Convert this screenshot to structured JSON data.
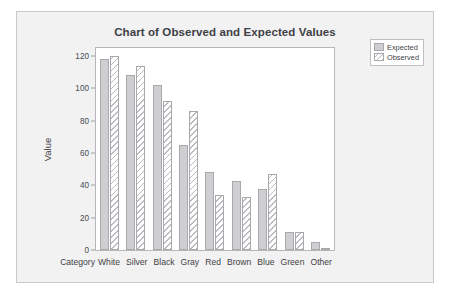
{
  "chart_data": {
    "type": "bar",
    "title": "Chart of Observed and Expected Values",
    "xlabel": "Category",
    "ylabel": "Value",
    "ylim": [
      0,
      125
    ],
    "yticks": [
      0,
      20,
      40,
      60,
      80,
      100,
      120
    ],
    "ytick_labels": [
      "0",
      "20",
      "40",
      "60",
      "80",
      "100",
      "120"
    ],
    "grid": false,
    "legend_position": "top-right-outside",
    "categories": [
      "White",
      "Silver",
      "Black",
      "Gray",
      "Red",
      "Brown",
      "Blue",
      "Green",
      "Other"
    ],
    "series": [
      {
        "name": "Expected",
        "style": "solid-gray-fill",
        "color": "#cfcfd1",
        "values": [
          118,
          108,
          102,
          65,
          48,
          43,
          37.5,
          11,
          5
        ]
      },
      {
        "name": "Observed",
        "style": "diagonal-hatch",
        "color": "#bcbcc0",
        "values": [
          120,
          114,
          92,
          86,
          34,
          33,
          47,
          11,
          1
        ]
      }
    ]
  },
  "legend": {
    "entries": [
      {
        "label": "Expected"
      },
      {
        "label": "Observed"
      }
    ]
  }
}
